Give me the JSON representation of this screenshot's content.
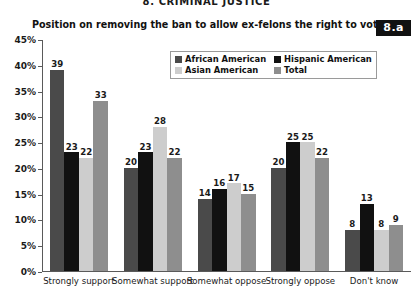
{
  "section_header": "8. CRIMINAL JUSTICE",
  "badge": "8.a",
  "chart_data": {
    "type": "bar",
    "title": "Position on removing the ban to allow ex-felons the right to vote?",
    "xlabel": "",
    "ylabel": "",
    "ylim": [
      0,
      45
    ],
    "ytick_labels": [
      "0%",
      "5%",
      "10%",
      "15%",
      "20%",
      "25%",
      "30%",
      "35%",
      "40%",
      "45%"
    ],
    "ytick_values": [
      0,
      5,
      10,
      15,
      20,
      25,
      30,
      35,
      40,
      45
    ],
    "grid": false,
    "legend_position": "top-center",
    "categories": [
      "Strongly support",
      "Somewhat support",
      "Somewhat oppose",
      "Strongly oppose",
      "Don't know"
    ],
    "series": [
      {
        "name": "African American",
        "color": "#4a4a4a",
        "values": [
          39,
          20,
          14,
          20,
          8
        ]
      },
      {
        "name": "Hispanic American",
        "color": "#111111",
        "values": [
          23,
          23,
          16,
          25,
          13
        ]
      },
      {
        "name": "Asian American",
        "color": "#cdcdcd",
        "values": [
          22,
          28,
          17,
          25,
          8
        ]
      },
      {
        "name": "Total",
        "color": "#8e8e8e",
        "values": [
          33,
          22,
          15,
          22,
          9
        ]
      }
    ]
  }
}
